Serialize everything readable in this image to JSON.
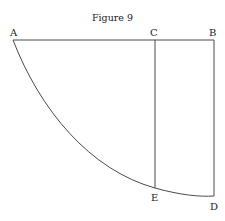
{
  "figure": {
    "title": "Figure 9",
    "labels": {
      "A": "A",
      "B": "B",
      "C": "C",
      "D": "D",
      "E": "E"
    },
    "line_color": "#4a4a4a"
  }
}
